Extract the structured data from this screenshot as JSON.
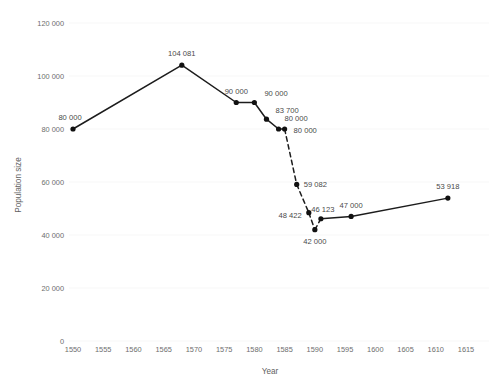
{
  "chart_data": {
    "type": "line",
    "title": "",
    "xlabel": "Year",
    "ylabel": "Population size",
    "xlim": [
      1550,
      1615
    ],
    "ylim": [
      0,
      120000
    ],
    "xticks": [
      1550,
      1555,
      1560,
      1565,
      1570,
      1575,
      1580,
      1585,
      1590,
      1595,
      1600,
      1605,
      1610,
      1615
    ],
    "xtick_labels": [
      "1550",
      "1555",
      "1560",
      "1565",
      "1570",
      "1575",
      "1580",
      "1585",
      "1590",
      "1595",
      "1600",
      "1605",
      "1610",
      "1615"
    ],
    "yticks": [
      0,
      20000,
      40000,
      60000,
      80000,
      100000,
      120000
    ],
    "ytick_labels": [
      "0",
      "20 000",
      "40 000",
      "60 000",
      "80 000",
      "100 000",
      "120 000"
    ],
    "grid": "faint-horizontal",
    "legend": "none",
    "series": [
      {
        "name": "Population size",
        "linestyle_segments": [
          "solid",
          "solid",
          "solid",
          "solid",
          "solid",
          "solid",
          "dashed",
          "dashed",
          "dashed",
          "dashed",
          "solid",
          "solid",
          "solid"
        ],
        "points": [
          {
            "x": 1550,
            "y": 80000,
            "label": "80 000",
            "label_dx": -3,
            "label_dy": -9,
            "label_anchor": "middle"
          },
          {
            "x": 1568,
            "y": 104081,
            "label": "104 081",
            "label_dx": 0,
            "label_dy": -9,
            "label_anchor": "middle"
          },
          {
            "x": 1577,
            "y": 90000,
            "label": "90 000",
            "label_dx": 0,
            "label_dy": -9,
            "label_anchor": "middle"
          },
          {
            "x": 1580,
            "y": 90000,
            "label": "90 000",
            "label_dx": 10,
            "label_dy": -7,
            "label_anchor": "start"
          },
          {
            "x": 1582,
            "y": 83700,
            "label": "83 700",
            "label_dx": 9,
            "label_dy": -6,
            "label_anchor": "start"
          },
          {
            "x": 1584,
            "y": 80000,
            "label": "80 000",
            "label_dx": 6,
            "label_dy": -8,
            "label_anchor": "start"
          },
          {
            "x": 1585,
            "y": 80000,
            "label": "80 000",
            "label_dx": 9,
            "label_dy": 4,
            "label_anchor": "start"
          },
          {
            "x": 1587,
            "y": 59082,
            "label": "59 082",
            "label_dx": 7,
            "label_dy": 3,
            "label_anchor": "start"
          },
          {
            "x": 1589,
            "y": 48422,
            "label": "48 422",
            "label_dx": -7,
            "label_dy": 5,
            "label_anchor": "end"
          },
          {
            "x": 1590,
            "y": 42000,
            "label": "42 000",
            "label_dx": 0,
            "label_dy": 14,
            "label_anchor": "middle"
          },
          {
            "x": 1591,
            "y": 46123,
            "label": "46 123",
            "label_dx": 2,
            "label_dy": -7,
            "label_anchor": "middle"
          },
          {
            "x": 1596,
            "y": 47000,
            "label": "47 000",
            "label_dx": 0,
            "label_dy": -8,
            "label_anchor": "middle"
          },
          {
            "x": 1612,
            "y": 53918,
            "label": "53 918",
            "label_dx": 0,
            "label_dy": -9,
            "label_anchor": "middle"
          }
        ]
      }
    ]
  },
  "colors": {
    "line": "#1c1c1c",
    "marker": "#111111",
    "tick_text": "#6e6e6e",
    "point_label_text": "#4a4a4a",
    "axis_title_text": "#5f5f5f",
    "gridline": "#f4f4f4",
    "background": "#ffffff"
  }
}
